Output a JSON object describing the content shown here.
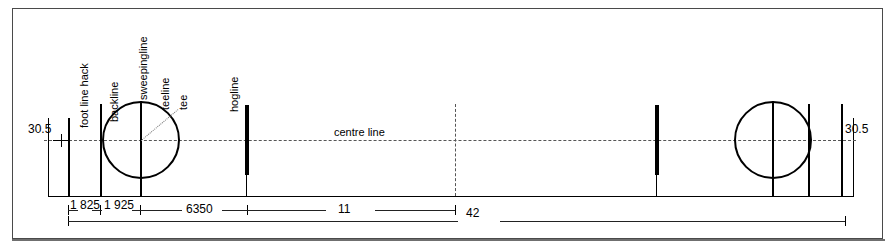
{
  "diagram": {
    "labels": {
      "foot_line_hack": "foot line hack",
      "backline": "backline",
      "sweepingline": "sweepingline",
      "teeline": "teeline",
      "tee": "tee",
      "hogline": "hogline",
      "centre_line": "centre line"
    },
    "edge_dimensions": {
      "left": "30.5",
      "right": "30.5"
    },
    "dimensions": [
      {
        "value": "1 825"
      },
      {
        "value": "1 925"
      },
      {
        "value": "6350"
      },
      {
        "value": "11"
      },
      {
        "value": "42"
      }
    ],
    "colors": {
      "line": "#000000",
      "dashed": "#555555",
      "frame": "#4a4a4a",
      "background": "#ffffff"
    }
  }
}
